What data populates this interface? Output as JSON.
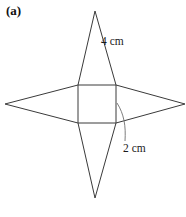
{
  "figure": {
    "part_label": "(a)",
    "background_color": "#ffffff",
    "line_color": "#3a3a3a",
    "leader_color": "#6e6e6e",
    "dimensions": [
      {
        "name": "slant-height",
        "value": "4 cm",
        "refers_to": "triangular flap slant edge"
      },
      {
        "name": "square-side",
        "value": "2 cm",
        "refers_to": "side of central square"
      }
    ],
    "geometry": {
      "square": {
        "top_left": [
          78,
          85
        ],
        "top_right": [
          116,
          85
        ],
        "bottom_right": [
          116,
          123
        ],
        "bottom_left": [
          78,
          123
        ]
      },
      "apexes": {
        "top": [
          95,
          11
        ],
        "bottom": [
          95,
          198
        ],
        "left": [
          5,
          104
        ],
        "right": [
          185,
          104
        ]
      }
    }
  }
}
